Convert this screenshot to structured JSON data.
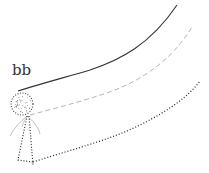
{
  "diagram": {
    "label": "bb",
    "colors": {
      "solid_line": "#333333",
      "dashed_line": "#b5b5b5",
      "dotted_line": "#222222",
      "body_outline": "#444444",
      "strands": "#bdbdbd"
    },
    "elements": [
      {
        "name": "solid-curve",
        "style": "solid"
      },
      {
        "name": "dashed-curve",
        "style": "dashed"
      },
      {
        "name": "dotted-curve",
        "style": "dotted"
      },
      {
        "name": "stippled-sphere",
        "style": "dotted-outline"
      },
      {
        "name": "dotted-tail",
        "style": "dotted"
      }
    ]
  }
}
